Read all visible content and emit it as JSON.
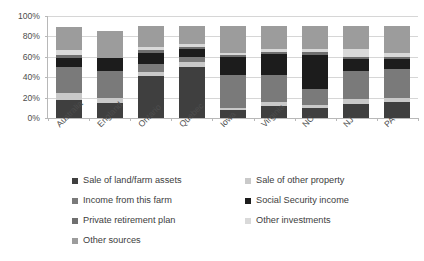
{
  "chart_data": {
    "type": "bar",
    "subtype": "stacked-100-percent",
    "title": "",
    "xlabel": "",
    "ylabel": "",
    "ylim": [
      0,
      100
    ],
    "ytick_labels": [
      "0%",
      "20%",
      "40%",
      "60%",
      "80%",
      "100%"
    ],
    "ytick_values": [
      0,
      20,
      40,
      60,
      80,
      100
    ],
    "grid": true,
    "legend_position": "bottom",
    "categories": [
      "Australia",
      "England",
      "Ontario",
      "Quebec",
      "Iowa",
      "Virginia",
      "NC",
      "NJ",
      "PA"
    ],
    "series": [
      {
        "name": "Sale of land/farm assets",
        "color": "#3f3f3f",
        "values": [
          18,
          15,
          41,
          50,
          8,
          12,
          10,
          14,
          16
        ]
      },
      {
        "name": "Sale of other property",
        "color": "#c9c9c9",
        "values": [
          7,
          5,
          4,
          5,
          2,
          4,
          3,
          5,
          4
        ]
      },
      {
        "name": "Income from this farm",
        "color": "#7a7a7a",
        "values": [
          25,
          26,
          8,
          5,
          32,
          26,
          15,
          27,
          28
        ]
      },
      {
        "name": "Social Security income",
        "color": "#1c1c1c",
        "values": [
          9,
          13,
          11,
          8,
          18,
          21,
          34,
          12,
          10
        ]
      },
      {
        "name": "Private retirement plan",
        "color": "#6f6f6f",
        "values": [
          3,
          0,
          3,
          2,
          2,
          2,
          3,
          2,
          2
        ]
      },
      {
        "name": "Other investments",
        "color": "#d9d9d9",
        "values": [
          5,
          0,
          3,
          3,
          2,
          3,
          3,
          8,
          4
        ]
      },
      {
        "name": "Other sources",
        "color": "#9c9c9c",
        "values": [
          22,
          26,
          20,
          17,
          26,
          22,
          22,
          22,
          26
        ]
      }
    ],
    "total": 100
  },
  "legend": {
    "items": [
      {
        "label": "Sale of land/farm assets",
        "color": "#3f3f3f"
      },
      {
        "label": "Sale of other property",
        "color": "#c9c9c9"
      },
      {
        "label": "Income from this farm",
        "color": "#7a7a7a"
      },
      {
        "label": "Social Security income",
        "color": "#1c1c1c"
      },
      {
        "label": "Private retirement plan",
        "color": "#6f6f6f"
      },
      {
        "label": "Other investments",
        "color": "#d9d9d9"
      },
      {
        "label": "Other sources",
        "color": "#9c9c9c"
      }
    ]
  },
  "axis": {
    "grid_color": "#d6d6d6",
    "axis_color": "#b8b8b8"
  }
}
